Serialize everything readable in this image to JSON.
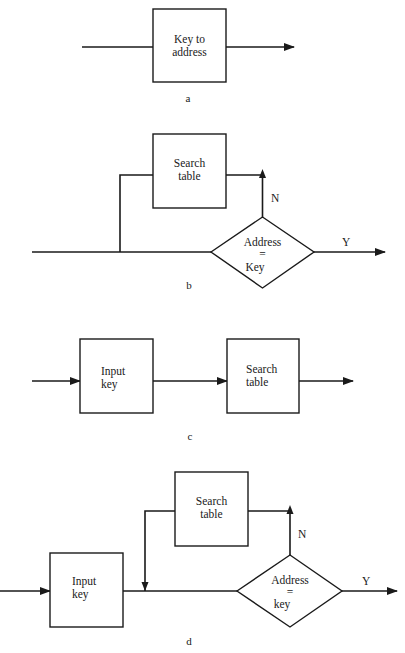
{
  "diagrams": {
    "a": {
      "caption": "a",
      "box": {
        "line1": "Key to",
        "line2": "address"
      }
    },
    "b": {
      "caption": "b",
      "search_box": {
        "line1": "Search",
        "line2": "table"
      },
      "decision": {
        "line1": "Address",
        "line2": "=",
        "line3": "Key"
      },
      "no_label": "N",
      "yes_label": "Y"
    },
    "c": {
      "caption": "c",
      "input_box": {
        "line1": "Input",
        "line2": "key"
      },
      "search_box": {
        "line1": "Search",
        "line2": "table"
      }
    },
    "d": {
      "caption": "d",
      "input_box": {
        "line1": "Input",
        "line2": "key"
      },
      "search_box": {
        "line1": "Search",
        "line2": "table"
      },
      "decision": {
        "line1": "Address",
        "line2": "=",
        "line3": "key"
      },
      "no_label": "N",
      "yes_label": "Y"
    }
  },
  "colors": {
    "ink": "#1a1a1a",
    "background": "#ffffff"
  }
}
